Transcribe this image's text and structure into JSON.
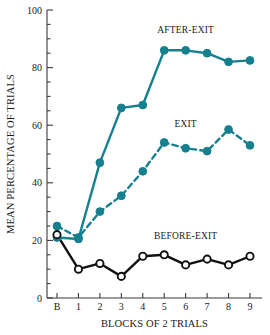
{
  "chart_data": {
    "type": "line",
    "title": "",
    "xlabel": "BLOCKS OF 2 TRIALS",
    "ylabel": "MEAN PERCENTAGE OF TRIALS",
    "categories": [
      "B",
      "1",
      "2",
      "3",
      "4",
      "5",
      "6",
      "7",
      "8",
      "9"
    ],
    "xtick_labels": [
      "B",
      "1",
      "2",
      "3",
      "4",
      "5",
      "6",
      "7",
      "8",
      "9"
    ],
    "ytick_labels": [
      "0",
      "20",
      "40",
      "60",
      "80",
      "100"
    ],
    "ytick_values": [
      0,
      20,
      40,
      60,
      80,
      100
    ],
    "yminor_step": 5,
    "ylim": [
      0,
      100
    ],
    "grid": false,
    "legend_position": "inline-annotations",
    "series": [
      {
        "name": "AFTER-EXIT",
        "values": [
          21,
          20.5,
          47,
          66,
          67,
          86,
          86,
          85,
          82,
          82.5
        ],
        "color": "#17808F",
        "line_style": "solid",
        "marker": "filled-circle",
        "label_x_category": "6",
        "label_y_value": 92
      },
      {
        "name": "EXIT",
        "values": [
          25,
          21,
          30,
          35.5,
          44,
          54,
          52,
          51,
          58.5,
          53
        ],
        "color": "#17808F",
        "line_style": "dashed",
        "marker": "filled-circle",
        "label_x_category": "6",
        "label_y_value": 59.5
      },
      {
        "name": "BEFORE-EXIT",
        "values": [
          22,
          10,
          12,
          7.5,
          14.5,
          15,
          11.5,
          13.5,
          11.5,
          14.5
        ],
        "color": "#111111",
        "line_style": "solid",
        "marker": "open-circle",
        "label_x_category": "6",
        "label_y_value": 20.5
      }
    ],
    "colors": {
      "teal": "#17808F",
      "black": "#111111",
      "background": "#ffffff",
      "axis": "#3a3a3a"
    }
  }
}
